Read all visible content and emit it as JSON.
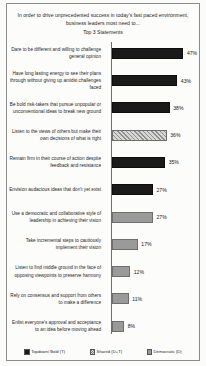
{
  "chart_data": {
    "type": "bar",
    "orientation": "horizontal",
    "title": "In order to drive unprecedented success in today's fast paced environment, business leaders most need to...",
    "subtitle": "Top 3 Statements",
    "xlabel": "",
    "ylabel": "",
    "xlim": [
      0,
      50
    ],
    "grid": false,
    "legend_position": "bottom",
    "categories": [
      "Dare to be different and willing to challenge  general opinion",
      "Have long lasting energy to see their plans through without giving up amidst challenges faced",
      "Be bold risk-takers  that pursue unpopular or unconventional ideas to break new ground",
      "Listen to the views of others but make their own decisions of what is right",
      "Remain firm in their course of action despite feedback and resistance",
      "Envision audacious ideas that don't yet exist",
      "Use a democratic and collaborative style of leadership  in achieving their vision",
      "Take incremental steps to cautiously implement their vision",
      "Listen to find middle ground in the face of opposing viewpoints  to preserve harmony",
      "Rely on consensus and support from others to make a difference",
      "Enlist everyone's approval and acceptance to an idea before moving ahead"
    ],
    "values": [
      47,
      43,
      38,
      36,
      35,
      27,
      27,
      17,
      12,
      11,
      8
    ],
    "value_labels": [
      "47%",
      "43%",
      "38%",
      "36%",
      "35%",
      "27%",
      "27%",
      "17%",
      "12%",
      "11%",
      "8%"
    ],
    "series_of_bar": [
      "topdown",
      "topdown",
      "topdown",
      "shared",
      "topdown",
      "topdown",
      "democratic",
      "democratic",
      "democratic",
      "democratic",
      "democratic"
    ],
    "legend": [
      {
        "key": "topdown",
        "label": "Topdown/ Bold (T)",
        "color": "#1a1a1a"
      },
      {
        "key": "shared",
        "label": "Shared (D+T)",
        "color": "#c2c2c2"
      },
      {
        "key": "democratic",
        "label": "Democratic (D)",
        "color": "#9a9a9a"
      }
    ]
  }
}
